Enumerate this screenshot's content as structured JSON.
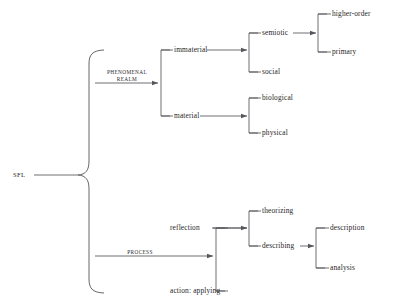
{
  "diagram": {
    "title": "SFL",
    "root": {
      "label": "SFL"
    },
    "edge_labels": {
      "phenomenal_realm_line1": "PHENOMENAL",
      "phenomenal_realm_line2": "REALM",
      "process": "PROCESS"
    },
    "nodes": {
      "immaterial": "immaterial",
      "material": "material",
      "semiotic": "semiotic",
      "social": "social",
      "higher_order": "higher-order",
      "primary": "primary",
      "biological": "biological",
      "physical": "physical",
      "reflection": "reflection",
      "action_applying": "action: applying",
      "theorizing": "theorizing",
      "describing": "describing",
      "description": "description",
      "analysis": "analysis"
    },
    "colors": {
      "line": "#55555a",
      "text": "#262626",
      "background": "#ffffff"
    }
  }
}
